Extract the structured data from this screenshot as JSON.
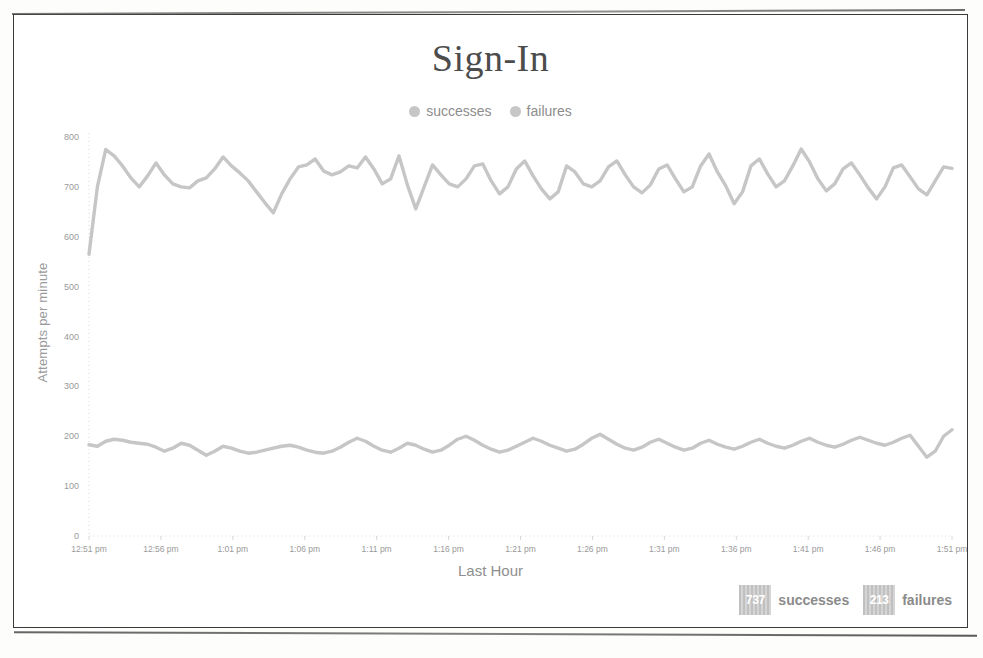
{
  "chart_data": {
    "type": "line",
    "title": "Sign-In",
    "xlabel": "Last Hour",
    "ylabel": "Attempts per minute",
    "grid": false,
    "legend_position": "top-center",
    "ylim": [
      0,
      800
    ],
    "yticks": [
      "0",
      "100",
      "200",
      "300",
      "400",
      "500",
      "600",
      "700",
      "800"
    ],
    "ytick_values": [
      0,
      100,
      200,
      300,
      400,
      500,
      600,
      700,
      800
    ],
    "xticks": [
      "12:51 pm",
      "12:56 pm",
      "1:01 pm",
      "1:06 pm",
      "1:11 pm",
      "1:16 pm",
      "1:21 pm",
      "1:26 pm",
      "1:31 pm",
      "1:36 pm",
      "1:41 pm",
      "1:46 pm",
      "1:51 pm"
    ],
    "colors": {
      "successes": "#c6c6c6",
      "failures": "#c6c6c6",
      "axis": "#d8d8d8",
      "text": "#9a9a9a"
    },
    "series": [
      {
        "name": "successes",
        "color": "#c6c6c6",
        "values": [
          565,
          700,
          775,
          762,
          742,
          718,
          700,
          722,
          748,
          724,
          706,
          700,
          698,
          712,
          718,
          736,
          760,
          742,
          728,
          712,
          690,
          668,
          648,
          686,
          716,
          740,
          744,
          756,
          732,
          724,
          730,
          742,
          738,
          760,
          736,
          706,
          716,
          762,
          704,
          656,
          700,
          744,
          724,
          706,
          700,
          716,
          742,
          746,
          712,
          686,
          700,
          736,
          752,
          722,
          696,
          676,
          690,
          742,
          730,
          706,
          700,
          712,
          740,
          752,
          724,
          700,
          688,
          704,
          736,
          744,
          716,
          690,
          700,
          742,
          766,
          730,
          702,
          666,
          690,
          742,
          756,
          726,
          700,
          712,
          742,
          776,
          750,
          716,
          692,
          706,
          736,
          748,
          724,
          698,
          676,
          700,
          738,
          744,
          720,
          696,
          684,
          712,
          740,
          737
        ]
      },
      {
        "name": "failures",
        "color": "#c6c6c6",
        "values": [
          183,
          180,
          190,
          194,
          192,
          188,
          186,
          184,
          178,
          170,
          176,
          186,
          182,
          172,
          162,
          170,
          180,
          176,
          170,
          166,
          168,
          172,
          176,
          180,
          182,
          178,
          172,
          168,
          166,
          170,
          178,
          188,
          196,
          190,
          180,
          172,
          168,
          176,
          186,
          182,
          174,
          168,
          172,
          182,
          194,
          200,
          192,
          182,
          174,
          168,
          172,
          180,
          188,
          196,
          190,
          182,
          176,
          170,
          174,
          184,
          196,
          204,
          194,
          184,
          176,
          172,
          178,
          188,
          194,
          186,
          178,
          172,
          176,
          186,
          192,
          184,
          178,
          174,
          180,
          188,
          194,
          186,
          180,
          176,
          182,
          190,
          196,
          188,
          182,
          178,
          184,
          192,
          198,
          192,
          186,
          182,
          188,
          196,
          202,
          180,
          158,
          170,
          200,
          213
        ]
      }
    ]
  },
  "legend": {
    "entries": [
      {
        "label": "successes",
        "color": "#c6c6c6"
      },
      {
        "label": "failures",
        "color": "#c6c6c6"
      }
    ]
  },
  "footer_stats": [
    {
      "value": "737",
      "label": "successes"
    },
    {
      "value": "213",
      "label": "failures"
    }
  ]
}
